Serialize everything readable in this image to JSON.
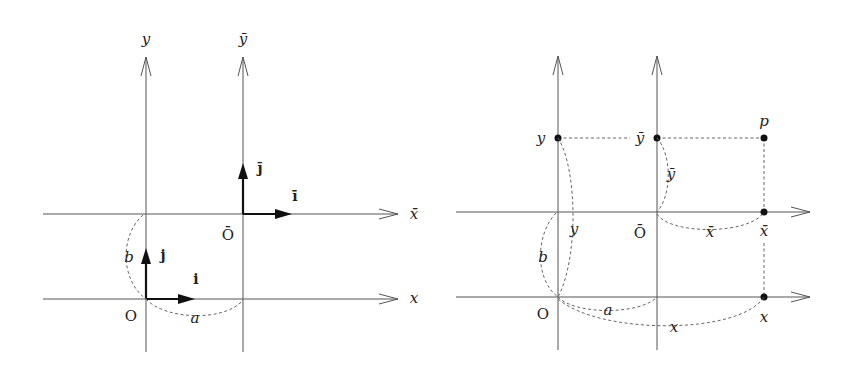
{
  "figure": {
    "left_panel": {
      "axis_labels": {
        "y": "y",
        "y_bar": "ȳ",
        "x_bar": "x̄",
        "x": "x"
      },
      "origin_labels": {
        "O": "O",
        "O_bar": "Ō"
      },
      "vector_labels": {
        "i": "i",
        "j": "j",
        "i_bar": "ī",
        "j_bar": "j̄"
      },
      "offset_labels": {
        "a": "a",
        "b": "b"
      }
    },
    "right_panel": {
      "point_label": "p",
      "axis_point_labels": {
        "y": "y",
        "y_bar": "ȳ",
        "x_bar": "x̄",
        "x": "x"
      },
      "distance_labels": {
        "y_bar_dist": "ȳ",
        "y_dist": "y",
        "x_bar_dist": "x̄",
        "x_dist": "x",
        "a": "a",
        "b": "b"
      },
      "origin_labels": {
        "O": "O",
        "O_bar": "Ō"
      }
    }
  }
}
